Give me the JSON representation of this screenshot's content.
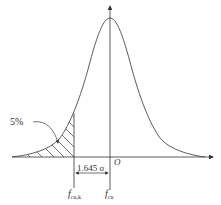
{
  "diagram": {
    "type": "normal-distribution",
    "labels": {
      "percent": "5%",
      "distance": "1.645 σ",
      "origin": "O",
      "fcuk_main": "f",
      "fcuk_sub": "cu,k",
      "fcu_main": "f",
      "fcu_sub": "cu"
    },
    "colors": {
      "stroke": "#333333",
      "background": "#ffffff"
    }
  }
}
